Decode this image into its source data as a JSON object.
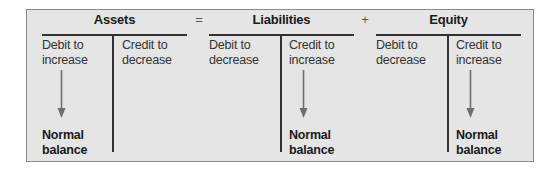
{
  "diagram": {
    "equation": {
      "operator_equals": "=",
      "operator_plus": "+"
    },
    "accounts": [
      {
        "title": "Assets",
        "debit": {
          "line1": "Debit to",
          "line2": "increase"
        },
        "credit": {
          "line1": "Credit to",
          "line2": "decrease"
        },
        "normal_balance_side": "debit",
        "normal_balance": {
          "line1": "Normal",
          "line2": "balance"
        }
      },
      {
        "title": "Liabilities",
        "debit": {
          "line1": "Debit to",
          "line2": "decrease"
        },
        "credit": {
          "line1": "Credit to",
          "line2": "increase"
        },
        "normal_balance_side": "credit",
        "normal_balance": {
          "line1": "Normal",
          "line2": "balance"
        }
      },
      {
        "title": "Equity",
        "debit": {
          "line1": "Debit to",
          "line2": "decrease"
        },
        "credit": {
          "line1": "Credit to",
          "line2": "increase"
        },
        "normal_balance_side": "credit",
        "normal_balance": {
          "line1": "Normal",
          "line2": "balance"
        }
      }
    ],
    "colors": {
      "background": "#e5e5e5",
      "border": "#8a8a8a",
      "lines": "#333333",
      "arrow": "#6e6e6e"
    },
    "icons": {
      "arrow": "arrow-down-icon"
    }
  }
}
